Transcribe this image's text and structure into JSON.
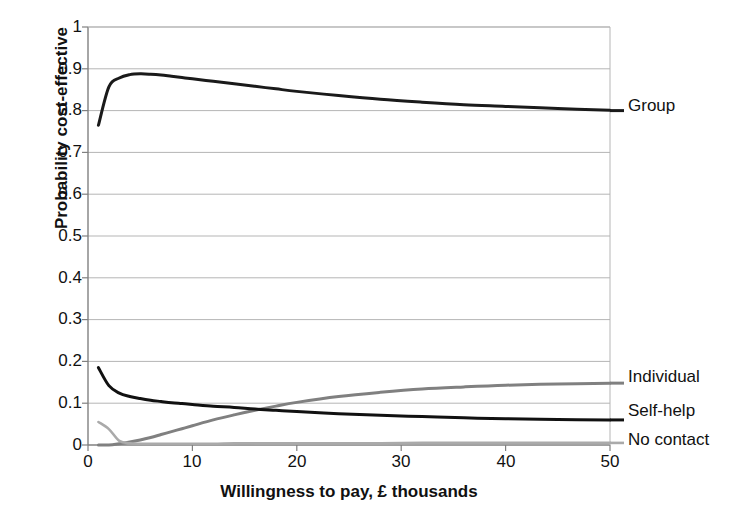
{
  "chart_data": {
    "type": "line",
    "title": "",
    "xlabel": "Willingness to pay, £ thousands",
    "ylabel": "Probability cost-effective",
    "xlim": [
      0,
      50
    ],
    "ylim": [
      0,
      1
    ],
    "xticks": [
      "0",
      "10",
      "20",
      "30",
      "40",
      "50"
    ],
    "yticks": [
      "0",
      "0.1",
      "0.2",
      "0.3",
      "0.4",
      "0.5",
      "0.6",
      "0.7",
      "0.8",
      "0.9",
      "1"
    ],
    "grid": "horizontal",
    "legend_position": "right-of-axes-inline",
    "x": [
      1,
      2,
      3,
      4,
      5,
      6,
      7,
      8,
      9,
      10,
      12,
      14,
      16,
      18,
      20,
      24,
      28,
      32,
      36,
      40,
      45,
      50
    ],
    "series": [
      {
        "name": "Group",
        "color": "#1a1a1a",
        "label_y": 0.8,
        "values": [
          0.765,
          0.857,
          0.878,
          0.886,
          0.888,
          0.887,
          0.885,
          0.882,
          0.879,
          0.876,
          0.87,
          0.864,
          0.858,
          0.852,
          0.846,
          0.836,
          0.827,
          0.82,
          0.814,
          0.81,
          0.805,
          0.801
        ]
      },
      {
        "name": "Individual",
        "color": "#808080",
        "label_y": 0.148,
        "values": [
          0.0,
          0.0,
          0.003,
          0.007,
          0.012,
          0.018,
          0.025,
          0.032,
          0.039,
          0.046,
          0.06,
          0.072,
          0.083,
          0.093,
          0.102,
          0.116,
          0.126,
          0.134,
          0.139,
          0.143,
          0.146,
          0.148
        ]
      },
      {
        "name": "Self-help",
        "color": "#111111",
        "label_y": 0.06,
        "values": [
          0.185,
          0.142,
          0.124,
          0.116,
          0.111,
          0.107,
          0.104,
          0.101,
          0.099,
          0.097,
          0.093,
          0.09,
          0.086,
          0.083,
          0.08,
          0.075,
          0.071,
          0.068,
          0.065,
          0.063,
          0.061,
          0.06
        ]
      },
      {
        "name": "No contact",
        "color": "#aaaaaa",
        "label_y": 0.005,
        "values": [
          0.055,
          0.038,
          0.01,
          0.004,
          0.003,
          0.003,
          0.003,
          0.003,
          0.003,
          0.003,
          0.003,
          0.004,
          0.004,
          0.004,
          0.004,
          0.004,
          0.004,
          0.005,
          0.005,
          0.005,
          0.005,
          0.005
        ]
      }
    ]
  },
  "axes": {
    "axis_color": "#808080",
    "grid_color": "#b5b5b5"
  }
}
